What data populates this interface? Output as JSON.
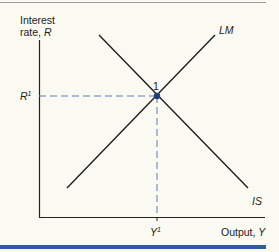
{
  "diagram": {
    "y_axis": {
      "label_line1": "Interest",
      "label_line2_prefix": "rate, ",
      "label_var": "R"
    },
    "x_axis": {
      "label_prefix": "Output, ",
      "label_var": "Y"
    },
    "curves": [
      {
        "name": "LM",
        "label": "LM",
        "slope": "upward"
      },
      {
        "name": "IS",
        "label": "IS",
        "slope": "downward"
      }
    ],
    "equilibrium": {
      "point_label": "1",
      "r_label": "R",
      "r_sup": "1",
      "y_label": "Y",
      "y_sup": "1",
      "point_color": "#1f3f7a"
    },
    "colors": {
      "background": "#fbfaf2",
      "axis": "#222222",
      "bar": "#2d5d9f",
      "dashed": "#4a6fb0"
    }
  }
}
